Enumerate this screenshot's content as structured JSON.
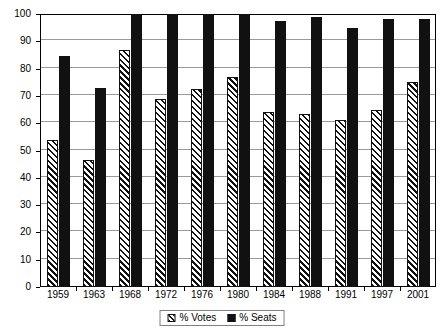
{
  "chart_data": {
    "type": "bar",
    "title": "",
    "subtitle": "",
    "xlabel": "",
    "ylabel": "",
    "ylim": [
      0,
      100
    ],
    "yticks": [
      0,
      10,
      20,
      30,
      40,
      50,
      60,
      70,
      80,
      90,
      100
    ],
    "ytick_labels": [
      "0",
      "10",
      "20",
      "30",
      "40",
      "50",
      "60",
      "70",
      "80",
      "90",
      "100"
    ],
    "grid": true,
    "legend_position": "bottom-center",
    "categories": [
      "1959",
      "1963",
      "1968",
      "1972",
      "1976",
      "1980",
      "1984",
      "1988",
      "1991",
      "1997",
      "2001"
    ],
    "series": [
      {
        "name": "% Votes",
        "fill": "diagonal-hatch",
        "values": [
          54,
          46.5,
          87,
          69,
          72.5,
          77,
          64,
          63.5,
          61,
          65,
          75
        ]
      },
      {
        "name": "% Seats",
        "fill": "solid-black",
        "values": [
          84.5,
          73,
          100,
          100,
          100,
          100,
          97.5,
          99,
          95,
          98,
          98
        ]
      }
    ]
  },
  "legend": {
    "entries": [
      {
        "label": "% Votes",
        "swatch": "hatched-swatch"
      },
      {
        "label": "% Seats",
        "swatch": "solid-black-swatch"
      }
    ]
  },
  "colors": {
    "series_votes": "#111111",
    "series_seats": "#111111",
    "gridline": "#9a9a9a",
    "axis": "#000000",
    "plot_background": "#ffffff",
    "legend_border": "#808080"
  }
}
